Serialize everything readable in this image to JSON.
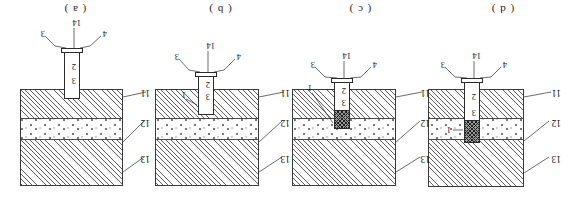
{
  "figure": {
    "title_visible": false,
    "orientation": "rotated-180",
    "panels": [
      {
        "id": "panel-d",
        "label": "( d )",
        "strata_labels": {
          "top": "13",
          "middle": "12",
          "bottom": "11"
        },
        "tube_labels": {
          "upper": "3",
          "lower": "2",
          "side": "1",
          "bottom_left": "4",
          "bottom_center": "14",
          "bottom_right": "3"
        },
        "has_side_label": true,
        "fill_style": "cross-hatch",
        "fill_depth": "dotted-layer"
      },
      {
        "id": "panel-c",
        "label": "( c )",
        "strata_labels": {
          "top": "13",
          "middle": "12",
          "bottom": "11"
        },
        "tube_labels": {
          "upper": "3",
          "lower": "2",
          "side": "1",
          "bottom_left": "4",
          "bottom_center": "14",
          "bottom_right": "3"
        },
        "has_side_label": true,
        "fill_style": "cross-hatch",
        "fill_depth": "lower-hatched-layer"
      },
      {
        "id": "panel-b",
        "label": "( b )",
        "strata_labels": {
          "top": "13",
          "middle": "12",
          "bottom": "11"
        },
        "tube_labels": {
          "upper": "3",
          "lower": "2",
          "side": "1",
          "bottom_left": "4",
          "bottom_center": "14",
          "bottom_right": "3"
        },
        "has_side_label": true,
        "fill_style": "none",
        "fill_depth": "none"
      },
      {
        "id": "panel-a",
        "label": "( a )",
        "strata_labels": {
          "top": "13",
          "middle": "12",
          "bottom": "11"
        },
        "tube_labels": {
          "upper": "3",
          "lower": "2",
          "side": "",
          "bottom_left": "4",
          "bottom_center": "14",
          "bottom_right": "3"
        },
        "has_side_label": false,
        "fill_style": "none",
        "fill_depth": "none"
      }
    ],
    "colors": {
      "line": "#2b2b2b",
      "hatch": "#5d5d5d",
      "dot": "#777777",
      "fill_dark": "#9a9a9a",
      "background": "#ffffff",
      "text": "#141414"
    }
  }
}
